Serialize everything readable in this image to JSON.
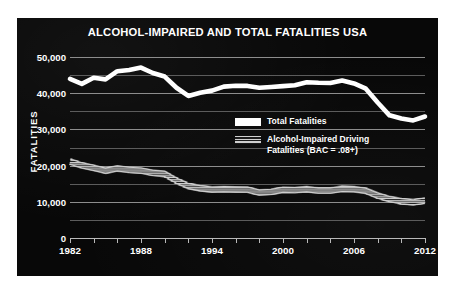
{
  "chart_data": {
    "type": "line",
    "title": "ALCOHOL-IMPAIRED AND TOTAL FATALITIES USA",
    "xlabel": "",
    "ylabel": "FATALITIES",
    "xlim": [
      1982,
      2012
    ],
    "ylim": [
      0,
      50000
    ],
    "grid": true,
    "legend_position": "inside-right",
    "y_ticks_major": [
      "0",
      "10,000",
      "20,000",
      "30,000",
      "40,000",
      "50,000"
    ],
    "y_tick_values_major": [
      0,
      10000,
      20000,
      30000,
      40000,
      50000
    ],
    "y_tick_values_minor": [
      5000,
      15000,
      25000,
      35000,
      45000
    ],
    "x_ticks": [
      "1982",
      "1988",
      "1994",
      "2000",
      "2006",
      "2012"
    ],
    "x_tick_values": [
      1982,
      1988,
      1994,
      2000,
      2006,
      2012
    ],
    "x_tick_marks": [
      1982,
      1984,
      1986,
      1988,
      1990,
      1992,
      1994,
      1996,
      1998,
      2000,
      2002,
      2004,
      2006,
      2008,
      2010,
      2012
    ],
    "x": [
      1982,
      1983,
      1984,
      1985,
      1986,
      1987,
      1988,
      1989,
      1990,
      1991,
      1992,
      1993,
      1994,
      1995,
      1996,
      1997,
      1998,
      1999,
      2000,
      2001,
      2002,
      2003,
      2004,
      2005,
      2006,
      2007,
      2008,
      2009,
      2010,
      2011,
      2012
    ],
    "series": [
      {
        "name": "Total Fatalities",
        "color": "#ffffff",
        "style": "solid",
        "values": [
          43945,
          42589,
          44257,
          43825,
          46087,
          46390,
          47087,
          45582,
          44599,
          41508,
          39250,
          40150,
          40716,
          41817,
          42065,
          42013,
          41501,
          41717,
          41945,
          42196,
          43005,
          42884,
          42836,
          43510,
          42708,
          41259,
          37423,
          33883,
          32999,
          32479,
          33561
        ]
      },
      {
        "name": "Alcohol-Impaired Driving Fatalities (BAC = .08+)",
        "color": "#cfcfcf",
        "style": "striped",
        "values": [
          21113,
          20051,
          19372,
          18595,
          19220,
          18826,
          18611,
          18000,
          17705,
          15827,
          14359,
          13739,
          13390,
          13478,
          13395,
          13365,
          12546,
          12744,
          13321,
          13233,
          13472,
          13096,
          13099,
          13582,
          13491,
          13041,
          11711,
          10759,
          10136,
          9865,
          10322
        ]
      }
    ]
  },
  "legend": [
    {
      "label": "Total Fatalities",
      "swatch": "solid-white"
    },
    {
      "label": "Alcohol-Impaired Driving Fatalities (BAC = .08+)",
      "swatch": "striped-gray"
    }
  ],
  "legend_lines": {
    "row1": "Total Fatalities",
    "row2_line1": "Alcohol-Impaired Driving",
    "row2_line2": "Fatalities (BAC = .08+)"
  },
  "colors": {
    "panel_background": "#080808",
    "page_background": "#ffffff",
    "gridline": "#8d8d8d",
    "gridline_minor": "#5c5c5c",
    "axis": "#b9b9b9",
    "text": "#ffffff",
    "total_series": "#ffffff",
    "alcohol_series": "#cfcfcf"
  }
}
